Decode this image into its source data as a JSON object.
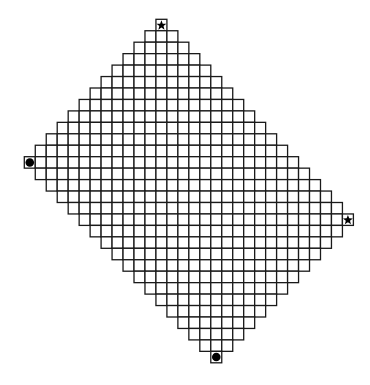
{
  "diagram": {
    "type": "rotated-rectangle-grid",
    "grid": {
      "origin_x": 24.3,
      "origin_y": 19.3,
      "cell_width": 10.97,
      "cell_height": 11.45,
      "rows": 30,
      "cols": 30,
      "line_color": "#1a1a1a",
      "fill_color": "#ffffff"
    },
    "region": {
      "description": "cells with 12 <= col+row <= 46 and -12 <= col-row <= 12",
      "sum_min": 12,
      "sum_max": 46,
      "diff_min": -12,
      "diff_max": 12
    },
    "corners": [
      {
        "name": "top",
        "col": 12,
        "row": 0,
        "marker": "star"
      },
      {
        "name": "left",
        "col": 0,
        "row": 12,
        "marker": "circle"
      },
      {
        "name": "right",
        "col": 29,
        "row": 17,
        "marker": "star"
      },
      {
        "name": "bottom",
        "col": 17,
        "row": 29,
        "marker": "circle"
      }
    ],
    "marker_color": "#000000"
  }
}
